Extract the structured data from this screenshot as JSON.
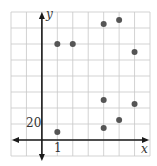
{
  "chart_data": {
    "type": "scatter",
    "title": "",
    "xlabel": "x",
    "ylabel": "y",
    "xlim": [
      -2,
      7
    ],
    "ylim": [
      -20,
      160
    ],
    "x_tick_step": 1,
    "y_tick_step": 20,
    "tick_labels": {
      "x": "1",
      "y": "20"
    },
    "grid": true,
    "legend": null,
    "points": [
      {
        "x": 1,
        "y": 120
      },
      {
        "x": 2,
        "y": 120
      },
      {
        "x": 4,
        "y": 145
      },
      {
        "x": 5,
        "y": 150
      },
      {
        "x": 6,
        "y": 110
      },
      {
        "x": 1,
        "y": 10
      },
      {
        "x": 4,
        "y": 50
      },
      {
        "x": 4,
        "y": 15
      },
      {
        "x": 5,
        "y": 25
      },
      {
        "x": 6,
        "y": 45
      }
    ],
    "colors": {
      "grid": "#c8c8c8",
      "axis": "#1a1a1a",
      "point": "#555555"
    }
  }
}
